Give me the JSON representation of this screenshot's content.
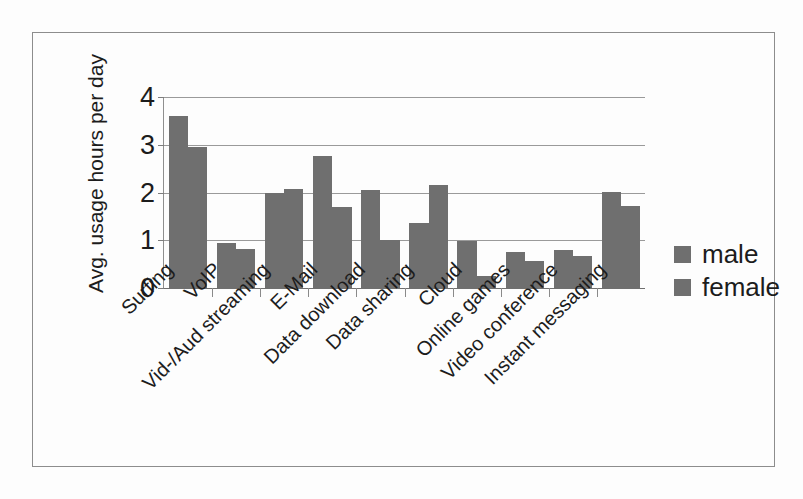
{
  "chart_data": {
    "type": "bar",
    "title": "",
    "subtitle": "",
    "xlabel": "",
    "ylabel": "Avg. usage hours per day",
    "ylim": [
      0,
      4
    ],
    "yticks": [
      0,
      1,
      2,
      3,
      4
    ],
    "ytick_labels": [
      "0",
      "1",
      "2",
      "3",
      "4"
    ],
    "grid": true,
    "grid_axis": "y",
    "legend_position": "right",
    "categories": [
      "Surfing",
      "VoIP",
      "Vid-/Aud streaming",
      "E-Mail",
      "Data download",
      "Data sharing",
      "Cloud",
      "Online games",
      "Video conference",
      "Instant messaging"
    ],
    "series": [
      {
        "name": "male",
        "color": "#6f6f6f",
        "values": [
          3.6,
          0.95,
          2.0,
          2.77,
          2.05,
          1.37,
          0.98,
          0.75,
          0.8,
          2.02
        ]
      },
      {
        "name": "female",
        "color": "#6f6f6f",
        "values": [
          2.95,
          0.82,
          2.08,
          1.7,
          1.0,
          2.15,
          0.25,
          0.57,
          0.68,
          1.72
        ]
      }
    ]
  },
  "legend": {
    "items": [
      {
        "label": "male",
        "color": "#6f6f6f"
      },
      {
        "label": "female",
        "color": "#6f6f6f"
      }
    ]
  },
  "axes": {
    "y_title": "Avg. usage hours per day"
  },
  "colors": {
    "bar": "#6f6f6f",
    "grid": "#9a9a9a",
    "axis": "#7d7d7d",
    "text": "#1c1c1c",
    "frame": "#8d8d8d",
    "background": "#fdfdfd"
  }
}
